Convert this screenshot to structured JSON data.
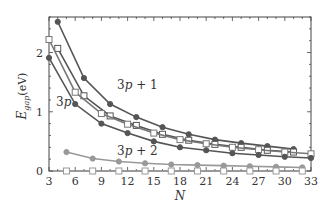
{
  "chart_data": {
    "type": "line",
    "title": "",
    "xlabel": "N",
    "ylabel": "E_gap(eV)",
    "ylabel_main": "E",
    "ylabel_sub": "gap",
    "ylabel_unit": "(eV)",
    "xlim": [
      3,
      33
    ],
    "ylim": [
      0,
      2.6
    ],
    "grid": false,
    "x_ticks": [
      3,
      6,
      9,
      12,
      15,
      18,
      21,
      24,
      27,
      30,
      33
    ],
    "y_ticks": [
      0,
      1,
      2
    ],
    "series": [
      {
        "name": "3p + 1 (filled)",
        "marker": "filled-circle",
        "color": "#555555",
        "x": [
          4,
          7,
          10,
          13,
          16,
          19,
          22,
          25,
          28,
          31
        ],
        "values": [
          2.52,
          1.57,
          1.13,
          0.91,
          0.74,
          0.62,
          0.53,
          0.47,
          0.42,
          0.37
        ]
      },
      {
        "name": "3p + 1 (open)",
        "marker": "open-square",
        "color": "#555555",
        "x": [
          4,
          7,
          10,
          13,
          16,
          19,
          22,
          25,
          28,
          31
        ],
        "values": [
          2.07,
          1.27,
          0.93,
          0.77,
          0.62,
          0.52,
          0.45,
          0.4,
          0.35,
          0.32
        ]
      },
      {
        "name": "3p (open)",
        "marker": "open-square",
        "color": "#777777",
        "x": [
          3,
          6,
          9,
          12,
          15,
          18,
          21,
          24,
          27,
          30,
          33
        ],
        "values": [
          2.22,
          1.33,
          0.97,
          0.79,
          0.64,
          0.53,
          0.46,
          0.4,
          0.36,
          0.32,
          0.29
        ]
      },
      {
        "name": "3p (filled)",
        "marker": "filled-circle",
        "color": "#555555",
        "x": [
          3,
          6,
          9,
          12,
          15,
          18,
          21,
          24,
          27,
          30,
          33
        ],
        "values": [
          1.91,
          1.13,
          0.8,
          0.64,
          0.5,
          0.4,
          0.35,
          0.3,
          0.27,
          0.24,
          0.22
        ]
      },
      {
        "name": "3p + 2 (filled)",
        "marker": "filled-circle",
        "color": "#999999",
        "x": [
          5,
          8,
          11,
          14,
          17,
          20,
          23,
          26,
          29,
          32
        ],
        "values": [
          0.32,
          0.21,
          0.16,
          0.13,
          0.11,
          0.1,
          0.09,
          0.08,
          0.07,
          0.06
        ]
      },
      {
        "name": "3p + 2 (open)",
        "marker": "open-square",
        "color": "#999999",
        "x": [
          5,
          8,
          11,
          14,
          17,
          20,
          23,
          26,
          29,
          32
        ],
        "values": [
          0,
          0,
          0,
          0,
          0,
          0,
          0,
          0,
          0,
          0
        ]
      }
    ],
    "annotations": [
      {
        "text": "3p + 1",
        "x": 10.8,
        "y": 1.38
      },
      {
        "text": "3p",
        "x": 3.8,
        "y": 1.1
      },
      {
        "text": "3p + 2",
        "x": 10.8,
        "y": 0.27
      }
    ]
  }
}
